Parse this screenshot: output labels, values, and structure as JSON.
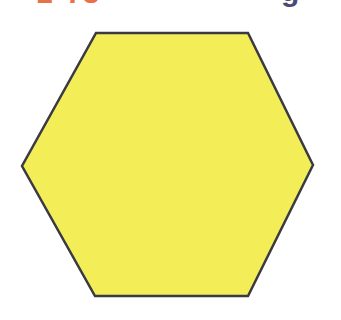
{
  "canvas": {
    "width": 341,
    "height": 320,
    "background_color": "#ffffff"
  },
  "clipped_text": {
    "description": "partial text cut off at the top edge of the image",
    "fragments": [
      {
        "text": "1",
        "color": "#e8714a",
        "x": 36
      },
      {
        "text": "73",
        "color": "#e8714a",
        "x": 66
      },
      {
        "text": "g",
        "color": "#4a4a78",
        "x": 281
      }
    ]
  },
  "shape": {
    "name": "hexagon",
    "label": "hexagon",
    "sides": 6,
    "fill_color": "#f3ed58",
    "stroke_color": "#3a3a42",
    "stroke_width": 2.5,
    "orientation": "pointy-left-right",
    "vertices": [
      {
        "x": 96,
        "y": 33
      },
      {
        "x": 248,
        "y": 33
      },
      {
        "x": 313,
        "y": 165
      },
      {
        "x": 248,
        "y": 296
      },
      {
        "x": 95,
        "y": 296
      },
      {
        "x": 22,
        "y": 166
      }
    ],
    "points_attr": "96,33 248,33 313,165 248,296 95,296 22,166"
  }
}
